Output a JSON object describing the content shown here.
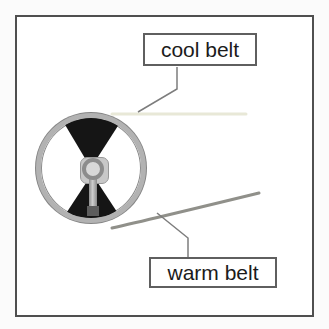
{
  "diagram": {
    "labels": {
      "cool": "cool belt",
      "warm": "warm belt"
    },
    "colors": {
      "frame_border": "#4f4f4f",
      "label_border": "#5f5f5f",
      "label_text": "#1b1b1b",
      "cool_belt": "#e8e8d7",
      "warm_belt": "#90908a",
      "leader_line": "#7d7d7d",
      "wheel_rim": "#b2b2b2",
      "wheel_sector": "#151515",
      "hub_plate": "#c8c8c8",
      "hub_ring": "#8c8c8c"
    }
  }
}
